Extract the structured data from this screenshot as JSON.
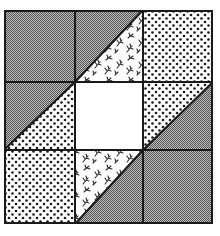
{
  "quilt_block": {
    "grid": {
      "rows": 3,
      "cols": 3
    },
    "colors": {
      "gray_dark": "#555555",
      "gray_light": "#bdbdbd",
      "dot": "#1a1a1a",
      "background": "#ffffff",
      "line": "#1a1a1a",
      "floral": "#2a2a2a"
    },
    "cells": [
      {
        "row": 0,
        "col": 0,
        "type": "solid",
        "fabric": "gray"
      },
      {
        "row": 0,
        "col": 1,
        "type": "half-square-triangle",
        "diagonal": "bl-tr",
        "upper_left": "gray",
        "lower_right": "floral"
      },
      {
        "row": 0,
        "col": 2,
        "type": "solid",
        "fabric": "dots"
      },
      {
        "row": 1,
        "col": 0,
        "type": "half-square-triangle",
        "diagonal": "bl-tr",
        "upper_left": "gray",
        "lower_right": "dots"
      },
      {
        "row": 1,
        "col": 1,
        "type": "solid",
        "fabric": "white"
      },
      {
        "row": 1,
        "col": 2,
        "type": "half-square-triangle",
        "diagonal": "bl-tr",
        "upper_left": "dots",
        "lower_right": "gray"
      },
      {
        "row": 2,
        "col": 0,
        "type": "solid",
        "fabric": "dots"
      },
      {
        "row": 2,
        "col": 1,
        "type": "half-square-triangle",
        "diagonal": "bl-tr",
        "upper_left": "floral",
        "lower_right": "gray"
      },
      {
        "row": 2,
        "col": 2,
        "type": "solid",
        "fabric": "gray"
      }
    ]
  }
}
